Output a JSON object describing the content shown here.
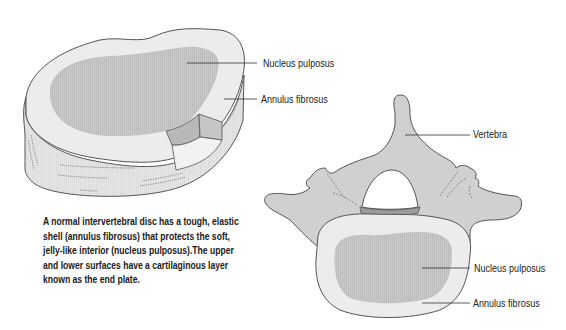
{
  "figure": {
    "disc_3d": {
      "labels": {
        "nucleus": "Nucleus pulposus",
        "annulus": "Annulus fibrosus"
      }
    },
    "vertebra_top": {
      "labels": {
        "vertebra": "Vertebra",
        "nucleus": "Nucleus pulposus",
        "annulus": "Annulus fibrosus"
      }
    },
    "caption": {
      "lines": [
        "A normal intervertebral disc has a tough, elastic",
        "shell (annulus fibrosus) that protects the soft,",
        "jelly-like interior (nucleus pulposus).The upper",
        "and lower surfaces have a cartilaginous layer",
        "known as the end plate."
      ]
    },
    "colors": {
      "annulus_fill": "#ececec",
      "nucleus_fill": "#c8c8c8",
      "bone_fill": "#d0d0d0",
      "cut_face": "#b5b5b5",
      "outline": "#555555",
      "leader_line": "#333333",
      "text": "#222222"
    }
  }
}
